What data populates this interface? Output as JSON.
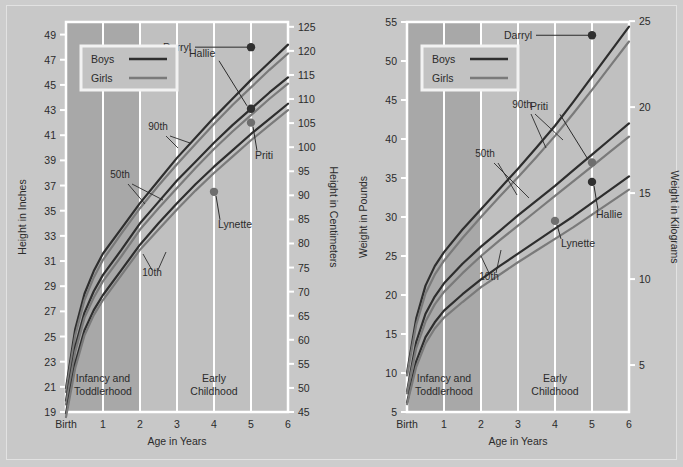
{
  "figure": {
    "background_color": "#cdcdcd",
    "panel_color": "#c0c0c0",
    "band_dark_color": "#a8a8a8",
    "grid_color": "#ffffff",
    "boys_color": "#2e2e2e",
    "girls_color": "#7a7a7a",
    "text_color": "#2b2b2b"
  },
  "legend": {
    "boys_label": "Boys",
    "girls_label": "Girls"
  },
  "bands": [
    {
      "label_line1": "Infancy and",
      "label_line2": "Toddlerhood",
      "x_start": 0,
      "x_end": 2
    },
    {
      "label_line1": "Early",
      "label_line2": "Childhood",
      "x_start": 2,
      "x_end": 6
    }
  ],
  "percentile_labels": [
    "90th",
    "50th",
    "10th"
  ],
  "chart_data": [
    {
      "id": "height-chart",
      "type": "line",
      "title": "",
      "xlabel": "Age in Years",
      "ylabel": "Height in Inches",
      "ylabel_right": "Height in Centimeters",
      "xlim": [
        0,
        6
      ],
      "ylim": [
        19,
        50
      ],
      "ylim_right": [
        45,
        126
      ],
      "grid": true,
      "legend_position": "top-left",
      "x_ticks": [
        0,
        1,
        2,
        3,
        4,
        5,
        6
      ],
      "x_tick_labels": [
        "Birth",
        "1",
        "2",
        "3",
        "4",
        "5",
        "6"
      ],
      "y_ticks": [
        19,
        21,
        23,
        25,
        27,
        29,
        31,
        33,
        35,
        37,
        39,
        41,
        43,
        45,
        47,
        49
      ],
      "y_tick_labels": [
        "19",
        "21",
        "23",
        "25",
        "27",
        "29",
        "31",
        "33",
        "35",
        "37",
        "39",
        "41",
        "43",
        "45",
        "47",
        "49"
      ],
      "y_ticks_right": [
        45,
        50,
        55,
        60,
        65,
        70,
        75,
        80,
        85,
        90,
        95,
        100,
        105,
        110,
        115,
        120,
        125
      ],
      "y_tick_labels_right": [
        "45",
        "50",
        "55",
        "60",
        "65",
        "70",
        "75",
        "80",
        "85",
        "90",
        "95",
        "100",
        "105",
        "110",
        "115",
        "120",
        "125"
      ],
      "x": [
        0,
        0.25,
        0.5,
        0.75,
        1,
        1.5,
        2,
        2.5,
        3,
        3.5,
        4,
        4.5,
        5,
        5.5,
        6
      ],
      "series": [
        {
          "name": "Boys 90th",
          "sex": "boys",
          "percentile": 90,
          "values": [
            20.9,
            25.6,
            28.4,
            30.2,
            31.6,
            33.6,
            35.6,
            37.4,
            39.2,
            40.8,
            42.4,
            43.9,
            45.4,
            46.8,
            48.2
          ]
        },
        {
          "name": "Girls 90th",
          "sex": "girls",
          "percentile": 90,
          "values": [
            20.6,
            25.1,
            27.9,
            29.7,
            31.1,
            33.2,
            35.2,
            37.0,
            38.7,
            40.3,
            41.9,
            43.4,
            44.8,
            46.2,
            47.5
          ]
        },
        {
          "name": "Boys 50th",
          "sex": "boys",
          "percentile": 50,
          "values": [
            19.9,
            24.2,
            26.9,
            28.6,
            29.9,
            31.9,
            34.0,
            35.7,
            37.4,
            38.9,
            40.4,
            41.8,
            43.1,
            44.4,
            45.6
          ]
        },
        {
          "name": "Girls 50th",
          "sex": "girls",
          "percentile": 50,
          "values": [
            19.6,
            23.8,
            26.5,
            28.1,
            29.4,
            31.4,
            33.5,
            35.2,
            36.8,
            38.4,
            39.9,
            41.3,
            42.6,
            43.9,
            45.1
          ]
        },
        {
          "name": "Boys 10th",
          "sex": "boys",
          "percentile": 10,
          "values": [
            18.9,
            22.9,
            25.5,
            27.1,
            28.3,
            30.3,
            32.3,
            34.0,
            35.6,
            37.1,
            38.5,
            39.8,
            41.1,
            42.3,
            43.5
          ]
        },
        {
          "name": "Girls 10th",
          "sex": "girls",
          "percentile": 10,
          "values": [
            18.6,
            22.5,
            25.1,
            26.7,
            27.9,
            29.9,
            31.9,
            33.5,
            35.1,
            36.6,
            38.0,
            39.3,
            40.6,
            41.8,
            43.0
          ]
        }
      ],
      "annotations": [
        {
          "label": "Darryl",
          "x": 5,
          "y": 48.0,
          "sex": "boys",
          "label_side": "left"
        },
        {
          "label": "Hallie",
          "x": 5,
          "y": 43.1,
          "sex": "boys",
          "label_side": "upleft"
        },
        {
          "label": "Priti",
          "x": 5,
          "y": 42.0,
          "sex": "girls",
          "label_side": "downright"
        },
        {
          "label": "Lynette",
          "x": 4,
          "y": 36.5,
          "sex": "girls",
          "label_side": "downright"
        }
      ]
    },
    {
      "id": "weight-chart",
      "type": "line",
      "title": "",
      "xlabel": "Age in Years",
      "ylabel": "Weight in Pounds",
      "ylabel_right": "Weight in Kilograms",
      "xlim": [
        0,
        6
      ],
      "ylim": [
        5,
        55
      ],
      "ylim_right": [
        2.27,
        24.95
      ],
      "grid": true,
      "legend_position": "top-left",
      "x_ticks": [
        0,
        1,
        2,
        3,
        4,
        5,
        6
      ],
      "x_tick_labels": [
        "Birth",
        "1",
        "2",
        "3",
        "4",
        "5",
        "6"
      ],
      "y_ticks": [
        5,
        10,
        15,
        20,
        25,
        30,
        35,
        40,
        45,
        50,
        55
      ],
      "y_tick_labels": [
        "5",
        "10",
        "15",
        "20",
        "25",
        "30",
        "35",
        "40",
        "45",
        "50",
        "55"
      ],
      "y_ticks_right": [
        2,
        5,
        10,
        15,
        20,
        25
      ],
      "y_tick_labels_right": [
        "2",
        "5",
        "10",
        "15",
        "20",
        "25"
      ],
      "x": [
        0,
        0.25,
        0.5,
        0.75,
        1,
        1.5,
        2,
        2.5,
        3,
        3.5,
        4,
        4.5,
        5,
        5.5,
        6
      ],
      "series": [
        {
          "name": "Boys 90th",
          "sex": "boys",
          "percentile": 90,
          "values": [
            10.0,
            17.0,
            21.2,
            23.7,
            25.5,
            28.4,
            31.0,
            33.6,
            36.2,
            38.9,
            41.7,
            44.8,
            48.0,
            51.2,
            54.4
          ]
        },
        {
          "name": "Girls 90th",
          "sex": "girls",
          "percentile": 90,
          "values": [
            9.7,
            16.2,
            20.2,
            22.6,
            24.4,
            27.3,
            30.0,
            32.6,
            35.1,
            37.7,
            40.4,
            43.3,
            46.3,
            49.4,
            52.5
          ]
        },
        {
          "name": "Boys 50th",
          "sex": "boys",
          "percentile": 50,
          "values": [
            7.6,
            14.0,
            17.6,
            19.8,
            21.5,
            24.0,
            26.2,
            28.2,
            30.2,
            32.1,
            34.0,
            36.0,
            38.0,
            40.0,
            42.0
          ]
        },
        {
          "name": "Girls 50th",
          "sex": "girls",
          "percentile": 50,
          "values": [
            7.4,
            13.2,
            16.6,
            18.8,
            20.4,
            22.8,
            25.0,
            27.0,
            28.9,
            30.8,
            32.7,
            34.6,
            36.5,
            38.4,
            40.3
          ]
        },
        {
          "name": "Boys 10th",
          "sex": "boys",
          "percentile": 10,
          "values": [
            6.2,
            11.5,
            14.6,
            16.5,
            18.0,
            20.1,
            22.0,
            23.7,
            25.3,
            26.9,
            28.5,
            30.1,
            31.8,
            33.5,
            35.2
          ]
        },
        {
          "name": "Girls 10th",
          "sex": "girls",
          "percentile": 10,
          "values": [
            6.0,
            10.8,
            13.8,
            15.7,
            17.1,
            19.1,
            21.0,
            22.6,
            24.2,
            25.7,
            27.2,
            28.7,
            30.3,
            31.9,
            33.5
          ]
        }
      ],
      "annotations": [
        {
          "label": "Darryl",
          "x": 5,
          "y": 53.3,
          "sex": "boys",
          "label_side": "left"
        },
        {
          "label": "Hallie",
          "x": 5,
          "y": 34.5,
          "sex": "boys",
          "label_side": "downright"
        },
        {
          "label": "Priti",
          "x": 5,
          "y": 37.0,
          "sex": "girls",
          "label_side": "upleft"
        },
        {
          "label": "Lynette",
          "x": 4,
          "y": 29.5,
          "sex": "girls",
          "label_side": "downleft"
        }
      ]
    }
  ]
}
